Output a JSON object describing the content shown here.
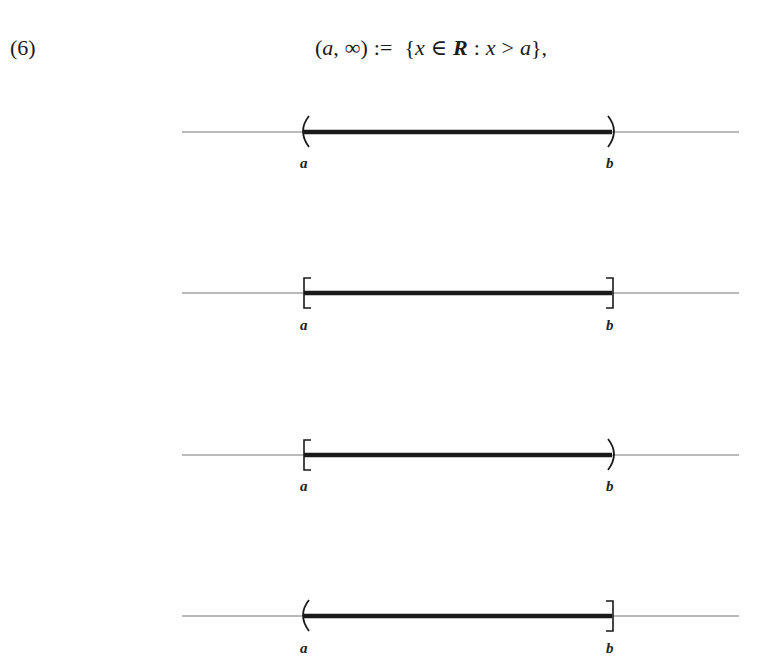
{
  "equation": {
    "number": "(6)",
    "lhs_open": "(",
    "lhs_a": "a",
    "lhs_comma": ",",
    "lhs_inf": "∞",
    "lhs_close": ")",
    "assign": ":=",
    "set_open": "{",
    "set_x": "x",
    "set_in": "∈",
    "set_R": "R",
    "set_colon": ":",
    "set_x2": "x",
    "set_gt": ">",
    "set_a": "a",
    "set_close": "},"
  },
  "figure": {
    "line_color": "#777777",
    "segment_color": "#1a1a1a",
    "intervals": [
      {
        "name": "open-open",
        "left_end": "(",
        "right_end": ")",
        "left_label": "a",
        "right_label": "b",
        "y": 132
      },
      {
        "name": "closed-closed",
        "left_end": "[",
        "right_end": "]",
        "left_label": "a",
        "right_label": "b",
        "y": 293
      },
      {
        "name": "closed-open",
        "left_end": "[",
        "right_end": ")",
        "left_label": "a",
        "right_label": "b",
        "y": 455
      },
      {
        "name": "open-closed",
        "left_end": "(",
        "right_end": "]",
        "left_label": "a",
        "right_label": "b",
        "y": 616
      }
    ]
  }
}
